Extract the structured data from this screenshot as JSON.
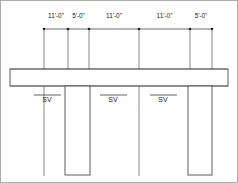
{
  "drawing": {
    "type": "structural-elevation",
    "units": "feet-inches",
    "dimension_string_label": "Overall dimension string",
    "dimensions": [
      {
        "label": "11'-0\"",
        "start_x": 44,
        "end_x": 68
      },
      {
        "label": "5'-0\"",
        "start_x": 68,
        "end_x": 89
      },
      {
        "label": "11'-0\"",
        "start_x": 89,
        "end_x": 139
      },
      {
        "label": "11'-0\"",
        "start_x": 139,
        "end_x": 190
      },
      {
        "label": "5'-0\"",
        "start_x": 190,
        "end_x": 212
      }
    ],
    "dimension_line_y": 29,
    "dimension_text_y": 18,
    "grid_ticks": [
      44,
      68,
      89,
      139,
      190,
      212
    ],
    "extension_lines": [
      {
        "x": 44,
        "y_top": 29,
        "y_bottom": 70
      },
      {
        "x": 68,
        "y_top": 29,
        "y_bottom": 70
      },
      {
        "x": 89,
        "y_top": 29,
        "y_bottom": 70
      },
      {
        "x": 139,
        "y_top": 29,
        "y_bottom": 70
      },
      {
        "x": 190,
        "y_top": 29,
        "y_bottom": 70
      },
      {
        "x": 212,
        "y_top": 29,
        "y_bottom": 70
      }
    ],
    "slab": {
      "name": "hatched-horizontal-beam",
      "x": 10,
      "y": 69,
      "width": 218,
      "height": 17
    },
    "columns": [
      {
        "name": "hatched-column-left",
        "x": 65,
        "y": 86,
        "width": 25,
        "height": 89
      },
      {
        "name": "hatched-column-right",
        "x": 188,
        "y": 86,
        "width": 24,
        "height": 89
      }
    ],
    "thin_verticals": [
      {
        "x": 44,
        "y_top": 86,
        "y_bottom": 176
      },
      {
        "x": 139,
        "y_top": 86,
        "y_bottom": 176
      }
    ],
    "annotations": [
      {
        "label": "SV",
        "x": 47,
        "y": 101,
        "leader_x1": 34,
        "leader_x2": 61,
        "leader_y": 95
      },
      {
        "label": "SV",
        "x": 113,
        "y": 101,
        "leader_x1": 100,
        "leader_x2": 127,
        "leader_y": 95
      },
      {
        "label": "SV",
        "x": 163,
        "y": 101,
        "leader_x1": 150,
        "leader_x2": 177,
        "leader_y": 95
      }
    ],
    "colors": {
      "line": "#4a4a4a",
      "hatch": "#8a8a8a",
      "text": "#1a1a1a",
      "background": "#ffffff",
      "border": "#9a9a9a"
    }
  }
}
